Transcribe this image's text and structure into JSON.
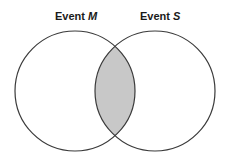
{
  "diagram": {
    "type": "venn",
    "sets": [
      {
        "id": "M",
        "label_prefix": "Event ",
        "label_var": "M",
        "center": [
          75,
          91
        ],
        "radius": 60
      },
      {
        "id": "S",
        "label_prefix": "Event ",
        "label_var": "S",
        "center": [
          155,
          91
        ],
        "radius": 60
      }
    ],
    "shaded_region": "M ∩ S",
    "colors": {
      "stroke": "#3a3a3a",
      "intersection_fill": "#c8c8c8",
      "background": "#ffffff"
    }
  }
}
